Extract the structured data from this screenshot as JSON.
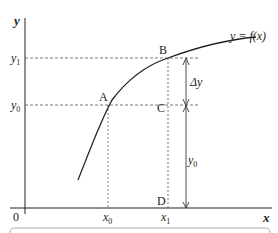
{
  "diagram": {
    "axes": {
      "x_label": "x",
      "y_label": "y",
      "origin_label": "0"
    },
    "curve_label": "y = f(x)",
    "points": [
      {
        "name": "A",
        "label": "A"
      },
      {
        "name": "B",
        "label": "B"
      },
      {
        "name": "C",
        "label": "C"
      },
      {
        "name": "D",
        "label": "D"
      }
    ],
    "x_ticks": [
      {
        "label": "x",
        "sub": "0"
      },
      {
        "label": "x",
        "sub": "1"
      }
    ],
    "y_ticks": [
      {
        "label": "y",
        "sub": "1"
      },
      {
        "label": "y",
        "sub": "0"
      }
    ],
    "measures": {
      "delta_y": "Δy",
      "y0": "y",
      "y0_sub": "0"
    },
    "colors": {
      "line": "#231f20",
      "dashed": "#555555"
    }
  }
}
